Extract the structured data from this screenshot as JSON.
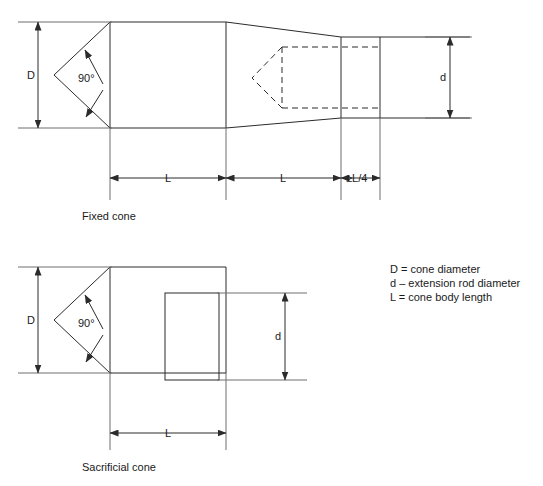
{
  "figure": {
    "line_color": "#2b2b2b",
    "extension_line_color": "#6e6e6e",
    "background": "#ffffff"
  },
  "fixed_cone": {
    "caption": "Fixed cone",
    "dimensions": {
      "diameter_label": "D",
      "rod_diameter_label": "d",
      "angle_label": "90°",
      "length_1_label": "L",
      "length_2_label": "L",
      "length_3_label": "≥L/4"
    }
  },
  "sacrificial_cone": {
    "caption": "Sacrificial cone",
    "dimensions": {
      "diameter_label": "D",
      "rod_diameter_label": "d",
      "angle_label": "90°",
      "length_label": "L"
    }
  },
  "legend": {
    "items": [
      {
        "symbol": "D",
        "separator": "=",
        "description": "cone diameter"
      },
      {
        "symbol": "d",
        "separator": "–",
        "description": "extension rod diameter"
      },
      {
        "symbol": "L",
        "separator": "=",
        "description": "cone body length"
      }
    ],
    "lines": [
      "D  =  cone diameter",
      "d  –  extension rod diameter",
      "L  =  cone body length"
    ]
  }
}
